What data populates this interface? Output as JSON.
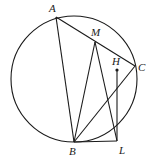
{
  "diagram": {
    "type": "geometry",
    "circle": {
      "cx": 74,
      "cy": 79,
      "r": 63
    },
    "points": {
      "A": {
        "x": 56,
        "y": 17,
        "label": "A",
        "lx": 49,
        "ly": 12
      },
      "M": {
        "x": 95,
        "y": 42,
        "label": "M",
        "lx": 91,
        "ly": 36
      },
      "C": {
        "x": 135,
        "y": 66,
        "label": "C",
        "lx": 138,
        "ly": 71
      },
      "H": {
        "x": 117,
        "y": 70,
        "label": "H",
        "lx": 112,
        "ly": 65
      },
      "B": {
        "x": 74,
        "y": 142,
        "label": "B",
        "lx": 69,
        "ly": 155
      },
      "L": {
        "x": 117,
        "y": 141,
        "label": "L",
        "lx": 119,
        "ly": 154
      }
    },
    "segments": [
      [
        "A",
        "C"
      ],
      [
        "A",
        "B"
      ],
      [
        "B",
        "M"
      ],
      [
        "M",
        "L"
      ],
      [
        "B",
        "C"
      ],
      [
        "B",
        "L"
      ],
      [
        "H",
        "L"
      ]
    ],
    "stroke_color": "#1a1a1a"
  }
}
